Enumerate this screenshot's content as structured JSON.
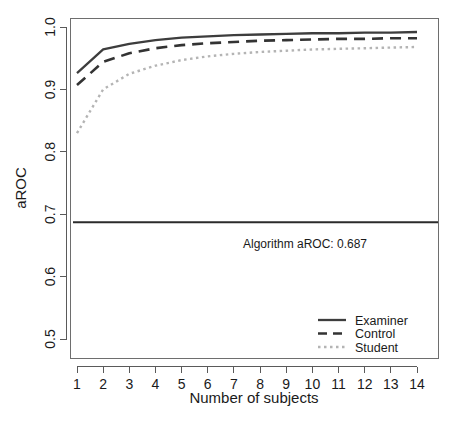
{
  "chart_data": {
    "type": "line",
    "title": "",
    "subtitle": "",
    "xlabel": "Number of subjects",
    "ylabel": "aROC",
    "x": [
      1,
      2,
      3,
      4,
      5,
      6,
      7,
      8,
      9,
      10,
      11,
      12,
      13,
      14
    ],
    "xlim": [
      0.5,
      14.5
    ],
    "ylim": [
      0.5,
      1.0
    ],
    "xticks": [
      "1",
      "2",
      "3",
      "4",
      "5",
      "6",
      "7",
      "8",
      "9",
      "10",
      "11",
      "12",
      "13",
      "14"
    ],
    "yticks": [
      "0.5",
      "0.6",
      "0.7",
      "0.8",
      "0.9",
      "1.0"
    ],
    "grid": false,
    "legend_position": "bottom-right",
    "series": [
      {
        "name": "Examiner",
        "style": "solid",
        "color": "#3d3d3d",
        "values": [
          0.926,
          0.964,
          0.973,
          0.979,
          0.983,
          0.985,
          0.987,
          0.988,
          0.989,
          0.99,
          0.99,
          0.991,
          0.991,
          0.992
        ]
      },
      {
        "name": "Control",
        "style": "dashed",
        "color": "#333333",
        "values": [
          0.907,
          0.944,
          0.958,
          0.966,
          0.971,
          0.974,
          0.976,
          0.978,
          0.979,
          0.98,
          0.981,
          0.981,
          0.982,
          0.982
        ]
      },
      {
        "name": "Student",
        "style": "dotted",
        "color": "#b4b4b4",
        "values": [
          0.83,
          0.9,
          0.925,
          0.938,
          0.947,
          0.953,
          0.957,
          0.96,
          0.962,
          0.964,
          0.965,
          0.966,
          0.967,
          0.968
        ]
      }
    ],
    "reference_line": {
      "label": "Algorithm aROC: 0.687",
      "value": 0.687,
      "color": "#2b2b2b",
      "style": "solid"
    }
  },
  "legend": {
    "entries": [
      {
        "label": "Examiner",
        "style": "solid",
        "color": "#3d3d3d"
      },
      {
        "label": "Control",
        "style": "dashed",
        "color": "#333333"
      },
      {
        "label": "Student",
        "style": "dotted",
        "color": "#b4b4b4"
      }
    ]
  },
  "annotation": {
    "algorithm_label": "Algorithm aROC: 0.687"
  },
  "axes": {
    "x_title": "Number of subjects",
    "y_title": "aROC"
  }
}
